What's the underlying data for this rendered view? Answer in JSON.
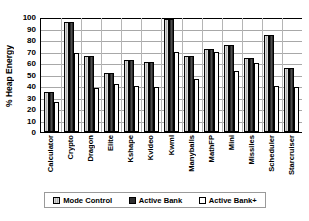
{
  "chart_data": {
    "type": "bar",
    "title": "",
    "xlabel": "",
    "ylabel": "% Heap Energy",
    "ylim": [
      0,
      100
    ],
    "yticks": [
      0,
      10,
      20,
      30,
      40,
      50,
      60,
      70,
      80,
      90,
      100
    ],
    "grid": true,
    "legend_position": "bottom",
    "categories": [
      "Calculator",
      "Crypto",
      "Dragon",
      "Elite",
      "Kshape",
      "Kvideo",
      "Kwml",
      "Manyballs",
      "MathFP",
      "Mini",
      "Missiles",
      "Scheduler",
      "Starcruiser"
    ],
    "series": [
      {
        "name": "Mode Control",
        "color": "#c8c8c8",
        "values": [
          35,
          96,
          66,
          51,
          63,
          61,
          98,
          66,
          72,
          76,
          64,
          84,
          56
        ]
      },
      {
        "name": "Active Bank",
        "color": "#2f2f2f",
        "values": [
          35,
          96,
          66,
          51,
          63,
          61,
          98,
          66,
          72,
          76,
          64,
          84,
          56
        ]
      },
      {
        "name": "Active Bank+",
        "color": "#ffffff",
        "values": [
          26,
          69,
          38,
          42,
          40,
          39,
          70,
          46,
          70,
          53,
          60,
          40,
          39
        ]
      }
    ]
  },
  "legend": {
    "items": [
      {
        "label": "Mode Control",
        "swatch": "light-gray-swatch"
      },
      {
        "label": "Active Bank",
        "swatch": "dark-gray-swatch"
      },
      {
        "label": "Active Bank+",
        "swatch": "white-swatch"
      }
    ]
  }
}
